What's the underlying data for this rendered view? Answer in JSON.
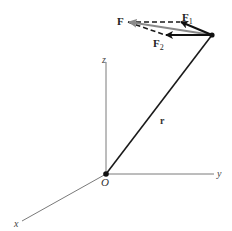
{
  "diagram": {
    "axes": {
      "x_label": "x",
      "y_label": "y",
      "z_label": "z",
      "origin_label": "O"
    },
    "position_vector": {
      "label": "r"
    },
    "forces": {
      "resultant": {
        "label": "F",
        "color": "#808080"
      },
      "component1": {
        "label": "F",
        "subscript": "1",
        "color": "#111111"
      },
      "component2": {
        "label": "F",
        "subscript": "2",
        "color": "#111111"
      }
    },
    "colors": {
      "axis": "#6e6e6e",
      "vector": "#1a1a1a",
      "resultant": "#8a8a8a",
      "dashed": "#1a1a1a"
    }
  }
}
